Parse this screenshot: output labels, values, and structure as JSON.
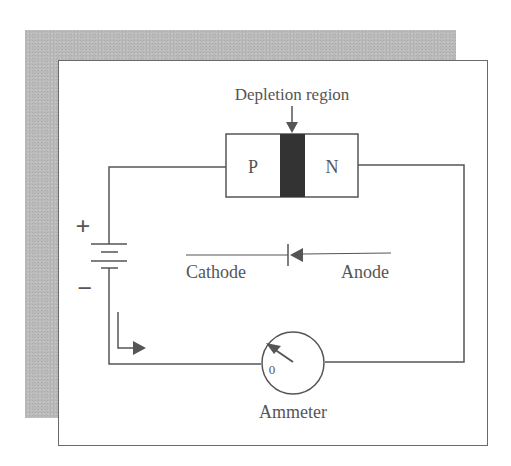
{
  "diagram": {
    "labels": {
      "depletion_region": "Depletion region",
      "p": "P",
      "n": "N",
      "plus": "+",
      "minus": "−",
      "cathode": "Cathode",
      "anode": "Anode",
      "ammeter_zero": "0",
      "ammeter": "Ammeter"
    },
    "colors": {
      "line": "#555555",
      "depletion": "#333333",
      "shadow": "#b9b9b9"
    }
  }
}
